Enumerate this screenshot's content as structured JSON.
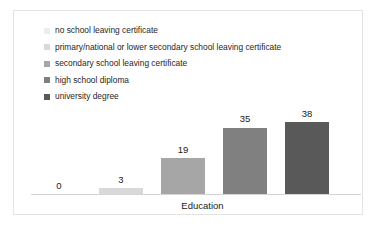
{
  "chart_data": {
    "type": "bar",
    "title": "",
    "xlabel": "Education",
    "ylabel": "",
    "grid": false,
    "legend_position": "top-left",
    "ylim": [
      0,
      45
    ],
    "categories": [
      "no school leaving certificate",
      "primary/national or lower secondary school leaving certificate",
      "secondary school leaving certificate",
      "high school diploma",
      "university degree"
    ],
    "values": [
      0,
      3,
      19,
      35,
      38
    ],
    "value_labels": [
      "0",
      "3",
      "19",
      "35",
      "38"
    ],
    "colors": [
      "#ededed",
      "#d9d9d9",
      "#a6a6a6",
      "#808080",
      "#595959"
    ]
  },
  "legend": {
    "items": [
      {
        "label": "no school leaving certificate",
        "color": "#ededed"
      },
      {
        "label": "primary/national or lower secondary school leaving certificate",
        "color": "#d9d9d9"
      },
      {
        "label": "secondary school leaving certificate",
        "color": "#a6a6a6"
      },
      {
        "label": "high school diploma",
        "color": "#808080"
      },
      {
        "label": "university degree",
        "color": "#595959"
      }
    ]
  },
  "axis": {
    "x_title": "Education"
  }
}
